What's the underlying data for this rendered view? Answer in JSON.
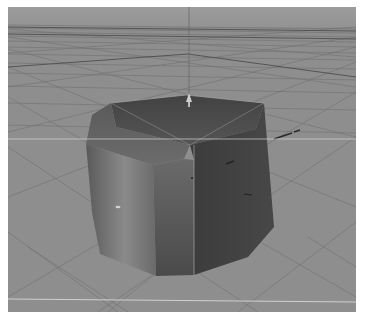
{
  "viewport": {
    "view": "perspective",
    "background_color": "#8e8e8e",
    "horizon_color": "#9a9a9a",
    "grid_color": "#6e6e6e",
    "grid_major_color": "#5a5a5a",
    "guide_line_color": "#d8d8d8"
  },
  "object": {
    "type": "beveled-cube",
    "colors": {
      "top": "#4a4a4a",
      "bevel": "#5c5c5c",
      "left": "#7a7a7a",
      "front": "#565656",
      "right": "#3e3e3e",
      "edge": "#b0b0b0"
    }
  },
  "gizmo": {
    "y_axis_color": "#bdbdbd",
    "x_axis_color": "#2a2a2a"
  }
}
